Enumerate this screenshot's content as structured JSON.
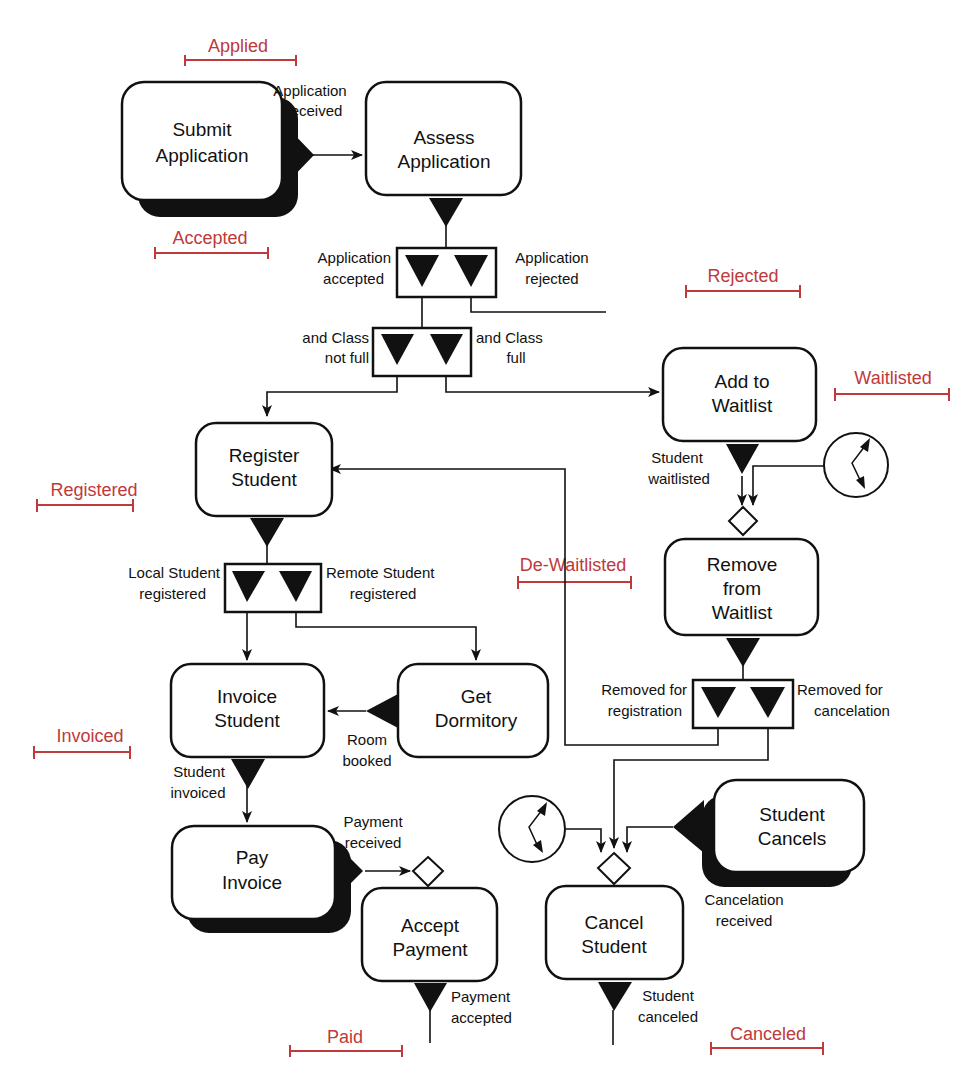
{
  "activities": {
    "submit_application": [
      "Submit",
      "Application"
    ],
    "assess_application": [
      "Assess",
      "Application"
    ],
    "add_to_waitlist": [
      "Add to",
      "Waitlist"
    ],
    "register_student": [
      "Register",
      "Student"
    ],
    "remove_from_waitlist": [
      "Remove",
      "from",
      "Waitlist"
    ],
    "invoice_student": [
      "Invoice",
      "Student"
    ],
    "get_dormitory": [
      "Get",
      "Dormitory"
    ],
    "pay_invoice": [
      "Pay",
      "Invoice"
    ],
    "accept_payment": [
      "Accept",
      "Payment"
    ],
    "student_cancels": [
      "Student",
      "Cancels"
    ],
    "cancel_student": [
      "Cancel",
      "Student"
    ]
  },
  "events": {
    "application_received": [
      "Application",
      "received"
    ],
    "application_accepted": [
      "Application",
      "accepted"
    ],
    "application_rejected": [
      "Application",
      "rejected"
    ],
    "class_not_full": [
      "and Class",
      "not full"
    ],
    "class_full": [
      "and Class",
      "full"
    ],
    "student_waitlisted": [
      "Student",
      "waitlisted"
    ],
    "local_student_registered": [
      "Local Student",
      "registered"
    ],
    "remote_student_registered": [
      "Remote Student",
      "registered"
    ],
    "removed_for_registration": [
      "Removed for",
      "registration"
    ],
    "removed_for_cancelation": [
      "Removed for",
      "cancelation"
    ],
    "room_booked": [
      "Room",
      "booked"
    ],
    "student_invoiced": [
      "Student",
      "invoiced"
    ],
    "payment_received": [
      "Payment",
      "received"
    ],
    "payment_accepted": [
      "Payment",
      "accepted"
    ],
    "cancelation_received": [
      "Cancelation",
      "received"
    ],
    "student_canceled": [
      "Student",
      "canceled"
    ]
  },
  "states": {
    "applied": "Applied",
    "accepted": "Accepted",
    "rejected": "Rejected",
    "waitlisted": "Waitlisted",
    "registered": "Registered",
    "de_waitlisted": "De-Waitlisted",
    "invoiced": "Invoiced",
    "paid": "Paid",
    "canceled": "Canceled"
  },
  "colors": {
    "state_label": "#c0393b",
    "outline": "#111111"
  }
}
